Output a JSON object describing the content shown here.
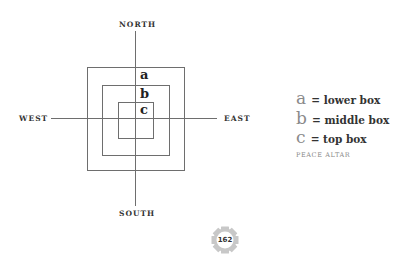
{
  "diagram": {
    "compass": {
      "north": "NORTH",
      "south": "SOUTH",
      "west": "WEST",
      "east": "EAST"
    },
    "boxes": [
      {
        "id": "a",
        "letter": "a",
        "role": "outer"
      },
      {
        "id": "b",
        "letter": "b",
        "role": "middle"
      },
      {
        "id": "c",
        "letter": "c",
        "role": "inner"
      }
    ],
    "colors": {
      "line": "#6e6e6e",
      "legend_letter": "#8a8a8a",
      "badge": "#c8c8c8"
    }
  },
  "legend": {
    "items": [
      {
        "letter": "a",
        "text": "= lower box"
      },
      {
        "letter": "b",
        "text": "= middle box"
      },
      {
        "letter": "c",
        "text": "= top box"
      }
    ],
    "caption": "PEACE ALTAR"
  },
  "page": {
    "number": "162"
  }
}
